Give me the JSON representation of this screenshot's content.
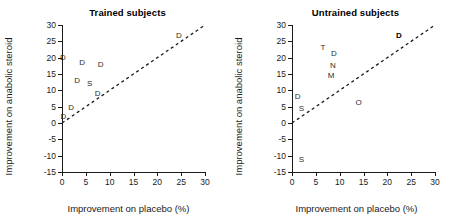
{
  "figure": {
    "panels": [
      {
        "id": "trained",
        "title": "Trained subjects",
        "xlabel": "Improvement on placebo (%)",
        "ylabel": "Improvement on anabolic steroid"
      },
      {
        "id": "untrained",
        "title": "Untrained subjects",
        "xlabel": "Improvement on placebo (%)",
        "ylabel": "Improvement on anabolic steroid"
      }
    ]
  },
  "axes": {
    "x_ticks": [
      "0",
      "5",
      "10",
      "15",
      "20",
      "25",
      "30"
    ],
    "y_ticks": [
      "30",
      "25",
      "20",
      "15",
      "10",
      "5",
      "0",
      "-5",
      "-10",
      "-15"
    ]
  },
  "chart_data": [
    {
      "type": "scatter",
      "title": "Trained subjects",
      "xlabel": "Improvement on placebo (%)",
      "ylabel": "Improvement on anabolic steroid",
      "xlim": [
        0,
        30
      ],
      "ylim": [
        -15,
        30
      ],
      "xticks": [
        0,
        5,
        10,
        15,
        20,
        25,
        30
      ],
      "yticks": [
        -15,
        -10,
        -5,
        0,
        5,
        10,
        15,
        20,
        25,
        30
      ],
      "grid": false,
      "legend": "none",
      "annotations": [
        "dashed line of identity (y = x)"
      ],
      "reference_line": {
        "style": "dashed",
        "slope": 1,
        "intercept": 0
      },
      "points": [
        {
          "label": "D",
          "x": 0.2,
          "y": 20.0,
          "bold": false
        },
        {
          "label": "D",
          "x": 4.2,
          "y": 18.5,
          "bold": false
        },
        {
          "label": "D",
          "x": 8.1,
          "y": 17.8,
          "bold": false
        },
        {
          "label": "D",
          "x": 3.2,
          "y": 13.0,
          "bold": false
        },
        {
          "label": "S",
          "x": 5.8,
          "y": 12.0,
          "bold": false
        },
        {
          "label": "D",
          "x": 7.5,
          "y": 9.0,
          "bold": false
        },
        {
          "label": "D",
          "x": 1.9,
          "y": 4.5,
          "bold": false
        },
        {
          "label": "D",
          "x": 0.3,
          "y": 1.8,
          "bold": false
        },
        {
          "label": "D",
          "x": 24.5,
          "y": 26.5,
          "bold": false
        }
      ]
    },
    {
      "type": "scatter",
      "title": "Untrained subjects",
      "xlabel": "Improvement on placebo (%)",
      "ylabel": "Improvement on anabolic steroid",
      "xlim": [
        0,
        30
      ],
      "ylim": [
        -15,
        30
      ],
      "xticks": [
        0,
        5,
        10,
        15,
        20,
        25,
        30
      ],
      "yticks": [
        -15,
        -10,
        -5,
        0,
        5,
        10,
        15,
        20,
        25,
        30
      ],
      "grid": false,
      "legend": "none",
      "annotations": [
        "dashed line of identity (y = x)"
      ],
      "reference_line": {
        "style": "dashed",
        "slope": 1,
        "intercept": 0
      },
      "points": [
        {
          "label": "T",
          "x": 6.5,
          "y": 23.0,
          "bold": false
        },
        {
          "label": "D",
          "x": 8.8,
          "y": 21.0,
          "bold": false
        },
        {
          "label": "N",
          "x": 8.6,
          "y": 17.5,
          "bold": false
        },
        {
          "label": "M",
          "x": 8.2,
          "y": 14.5,
          "bold": false
        },
        {
          "label": "O",
          "x": 14.0,
          "y": 6.2,
          "bold": false
        },
        {
          "label": "D",
          "x": 1.2,
          "y": 8.0,
          "bold": false
        },
        {
          "label": "S",
          "x": 2.0,
          "y": 4.3,
          "bold": false
        },
        {
          "label": "S",
          "x": 2.0,
          "y": -11.3,
          "bold": false
        },
        {
          "label": "D",
          "x": 22.4,
          "y": 26.5,
          "bold": true
        }
      ]
    }
  ]
}
